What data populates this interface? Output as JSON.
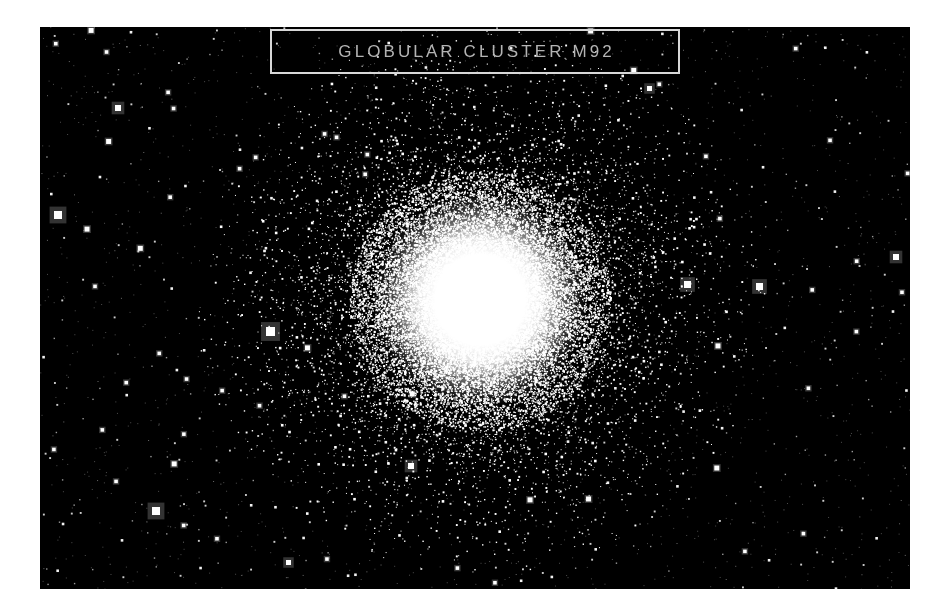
{
  "page": {
    "width": 947,
    "height": 614,
    "background_color": "#ffffff"
  },
  "photo": {
    "x": 40,
    "y": 27,
    "width": 870,
    "height": 562,
    "background_color": "#000000",
    "subject": "globular-cluster",
    "alt_text": "Globular cluster M92 — dense spherical swarm of stars with saturated white core on a black star-filled sky"
  },
  "title_plate": {
    "label": "GLOBULAR CLUSTER M92",
    "border_color": "#d8d8d8",
    "text_color": "#b4b4b4",
    "x": 270,
    "y": 29,
    "width": 410,
    "height": 45
  },
  "chart_data": {
    "type": "scatter",
    "title": "GLOBULAR CLUSTER M92",
    "xlabel": "",
    "ylabel": "",
    "xlim": [
      0,
      870
    ],
    "ylim": [
      0,
      562
    ],
    "grid": false,
    "legend": "none",
    "background": "#000000",
    "point_color": "#ffffff",
    "cluster": {
      "name": "M92",
      "center_x": 440,
      "center_y": 273,
      "core_radius": 58,
      "halo_radius": 205,
      "core_color": "#ffffff",
      "star_count": 26000,
      "falloff": "exponential"
    },
    "field_stars": {
      "count": 900,
      "min_size": 1,
      "max_size": 6
    },
    "named_bright_stars": [
      {
        "x": 226,
        "y": 300,
        "size": 9,
        "note": "bright-foreground-star-left"
      },
      {
        "x": 112,
        "y": 480,
        "size": 8,
        "note": "bright-foreground-star-lower-left"
      },
      {
        "x": 644,
        "y": 254,
        "size": 7,
        "note": "bright-foreground-star-right"
      },
      {
        "x": 14,
        "y": 184,
        "size": 8,
        "note": "bright-foreground-star-edge"
      },
      {
        "x": 368,
        "y": 436,
        "size": 6,
        "note": "bright-foreground-star-below-core"
      },
      {
        "x": 853,
        "y": 227,
        "size": 6,
        "note": "bright-foreground-star-far-right"
      },
      {
        "x": 75,
        "y": 78,
        "size": 6,
        "note": "bright-foreground-star-upper-left"
      },
      {
        "x": 607,
        "y": 59,
        "size": 5,
        "note": "bright-foreground-star-upper-right"
      },
      {
        "x": 716,
        "y": 256,
        "size": 7,
        "note": "bright-foreground-star-mid-right"
      },
      {
        "x": 246,
        "y": 533,
        "size": 5,
        "note": "bright-foreground-star-bottom"
      }
    ]
  }
}
